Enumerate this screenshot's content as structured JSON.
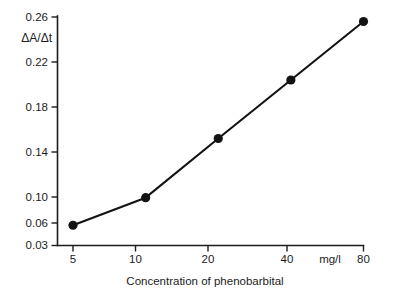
{
  "chart_data": {
    "type": "line",
    "title": "",
    "subtitle": "",
    "xlabel": "Concentration of phenobarbital",
    "ylabel": "ΔA/Δt",
    "x_unit": "mg/l",
    "x_scale": "log",
    "x": [
      5,
      10,
      20,
      40,
      80
    ],
    "values": [
      0.057,
      0.099,
      0.152,
      0.204,
      0.256
    ],
    "series": [
      {
        "name": "ΔA/Δt",
        "values": [
          0.057,
          0.099,
          0.152,
          0.204,
          0.256
        ]
      }
    ],
    "xtick_labels": [
      "5",
      "10",
      "20",
      "40",
      "80"
    ],
    "ytick_labels": [
      "0.03",
      "0.06",
      "0.10",
      "0.14",
      "0.18",
      "0.22",
      "0.26"
    ],
    "ytick_values": [
      0.03,
      0.06,
      0.1,
      0.14,
      0.18,
      0.22,
      0.26
    ],
    "ylim": [
      0.03,
      0.26
    ],
    "xlim": [
      5,
      80
    ],
    "grid": false,
    "legend": false,
    "legend_position": "none",
    "marker": "filled-circle",
    "line_color": "#131313",
    "marker_color": "#131313",
    "axis_color": "#1c1c1c",
    "background_color": "#ffffff"
  },
  "axes": {
    "y_label_delta_a": "ΔA",
    "y_label_slash": "/",
    "y_label_delta_t": "Δt",
    "x_title": "Concentration of phenobarbital",
    "x_unit_label": "mg/l"
  },
  "y_ticks": [
    {
      "label": "0.26"
    },
    {
      "label": "0.22"
    },
    {
      "label": "0.18"
    },
    {
      "label": "0.14"
    },
    {
      "label": "0.10"
    },
    {
      "label": "0.06"
    },
    {
      "label": "0.03"
    }
  ],
  "x_ticks": [
    {
      "label": "5"
    },
    {
      "label": "10"
    },
    {
      "label": "20"
    },
    {
      "label": "40"
    },
    {
      "label": "80"
    }
  ]
}
